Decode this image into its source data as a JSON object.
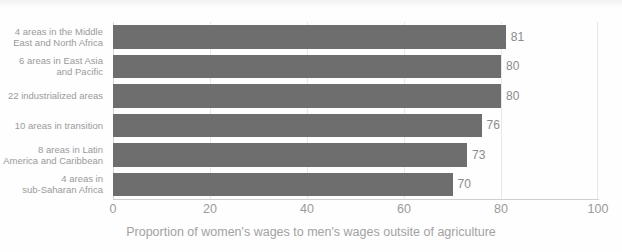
{
  "chart_data": {
    "type": "bar",
    "orientation": "horizontal",
    "title": "",
    "xlabel": "Proportion of women's wages to men's wages outsite of agriculture",
    "ylabel": "",
    "xlim": [
      0,
      100
    ],
    "xticks": [
      0,
      20,
      40,
      60,
      80,
      100
    ],
    "grid": true,
    "grid_axis": "x",
    "legend": false,
    "bar_color": "#6e6e6e",
    "label_color": "#9a9a9a",
    "background_color": "#fefefe",
    "categories": [
      "4 areas in the Middle East and North Africa",
      "6 areas in East Asia and Pacific",
      "22 industrialized areas",
      "10 areas in transition",
      "8 areas in Latin America and Caribbean",
      "4 areas in sub-Saharan Africa"
    ],
    "category_lines": [
      [
        "4 areas in the Middle",
        "East and North Africa"
      ],
      [
        "6 areas in East Asia",
        "and Pacific"
      ],
      [
        "22 industrialized areas"
      ],
      [
        "10 areas in transition"
      ],
      [
        "8 areas in Latin",
        "America and Caribbean"
      ],
      [
        "4 areas in",
        "sub-Saharan Africa"
      ]
    ],
    "values": [
      81,
      80,
      80,
      76,
      73,
      70
    ],
    "value_labels": [
      "81",
      "80",
      "80",
      "76",
      "73",
      "70"
    ]
  },
  "xtick_labels": [
    "0",
    "20",
    "40",
    "60",
    "80",
    "100"
  ]
}
